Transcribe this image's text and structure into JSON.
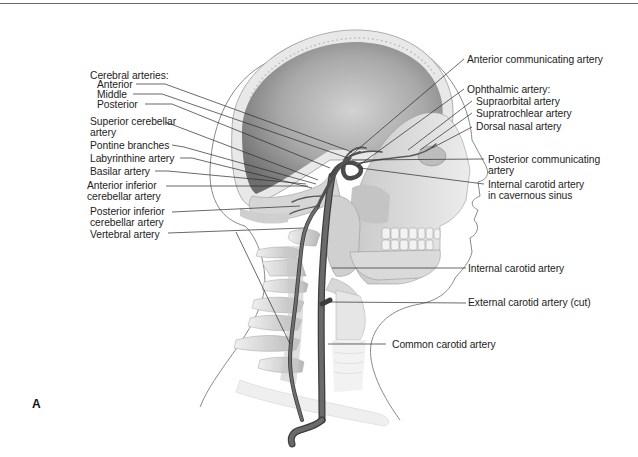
{
  "figure": {
    "panel_letter": "A"
  },
  "labels_left": {
    "cerebral_arteries_heading": "Cerebral arteries:",
    "anterior": "Anterior",
    "middle": "Middle",
    "posterior": "Posterior",
    "superior_cerebellar_1": "Superior cerebellar",
    "superior_cerebellar_2": "artery",
    "pontine_branches": "Pontine branches",
    "labyrinthine_artery": "Labyrinthine artery",
    "basilar_artery": "Basilar artery",
    "anterior_inferior_cerebellar_1": "Anterior inferior",
    "anterior_inferior_cerebellar_2": "cerebellar artery",
    "posterior_inferior_cerebellar_1": "Posterior inferior",
    "posterior_inferior_cerebellar_2": "cerebellar artery",
    "vertebral_artery": "Vertebral artery"
  },
  "labels_right": {
    "anterior_communicating_artery": "Anterior communicating artery",
    "ophthalmic_artery_heading": "Ophthalmic artery:",
    "supraorbital_artery": "Supraorbital artery",
    "supratrochlear_artery": "Supratrochlear artery",
    "dorsal_nasal_artery": "Dorsal nasal artery",
    "posterior_communicating_1": "Posterior communicating",
    "posterior_communicating_2": "artery",
    "internal_carotid_cavernous_1": "Internal carotid artery",
    "internal_carotid_cavernous_2": "in cavernous sinus",
    "internal_carotid_artery": "Internal carotid artery",
    "external_carotid_artery_cut": "External carotid artery (cut)",
    "common_carotid_artery": "Common carotid artery"
  },
  "colors": {
    "background": "#ffffff",
    "text": "#1d1d1d",
    "leader_line": "#2a2a2a",
    "artery": "#5c5c5c",
    "artery_dark": "#3d3d3d",
    "bone_light": "#dcdcdc",
    "bone_mid": "#b5b5b5",
    "skull_interior_dark": "#7a7a7a",
    "skin_outline": "#8a8a8a"
  }
}
